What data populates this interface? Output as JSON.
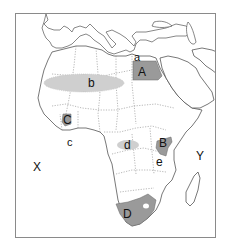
{
  "map": {
    "title": "",
    "subject": "Africa outline map with labeled regions",
    "colors": {
      "frame": "#8a8a8a",
      "land": "#ffffff",
      "coast": "#555555",
      "border": "#888888",
      "country_fill": "#9a9a9a",
      "zone_fill": "#cfcfcf"
    },
    "labels": {
      "A": "A",
      "B": "B",
      "C": "C",
      "D": "D",
      "a": "a",
      "b": "b",
      "c": "c",
      "d": "d",
      "e": "e",
      "X": "X",
      "Y": "Y"
    },
    "regions": [
      {
        "label": "A",
        "type": "shaded-country",
        "location": "Egypt"
      },
      {
        "label": "B",
        "type": "shaded-country",
        "location": "Kenya"
      },
      {
        "label": "C",
        "type": "shaded-country",
        "location": "Ghana"
      },
      {
        "label": "D",
        "type": "shaded-country",
        "location": "South Africa"
      },
      {
        "label": "b",
        "type": "shaded-zone",
        "location": "Sahara"
      },
      {
        "label": "d",
        "type": "shaded-zone",
        "location": "Congo Basin"
      },
      {
        "label": "a",
        "type": "point",
        "location": "Mediterranean / Nile delta"
      },
      {
        "label": "c",
        "type": "point",
        "location": "Gulf of Guinea"
      },
      {
        "label": "e",
        "type": "point",
        "location": "Great Rift Valley / Lake Tanganyika"
      },
      {
        "label": "X",
        "type": "ocean",
        "location": "Atlantic Ocean"
      },
      {
        "label": "Y",
        "type": "ocean",
        "location": "Indian Ocean"
      }
    ]
  }
}
